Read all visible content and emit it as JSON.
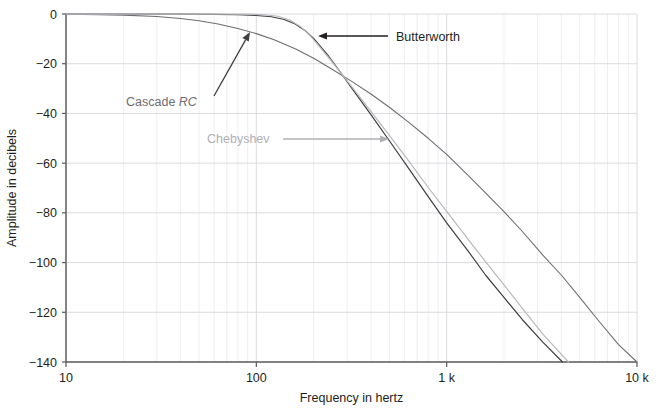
{
  "chart_data": {
    "type": "line",
    "title": "",
    "xlabel": "Frequency in hertz",
    "ylabel": "Amplitude in decibels",
    "xscale": "log",
    "yscale": "linear",
    "xlim": [
      10,
      10000
    ],
    "ylim": [
      -140,
      0
    ],
    "grid": true,
    "grid_minor": true,
    "legend": "annotations",
    "x_ticks": [
      {
        "value": 10,
        "label": "10"
      },
      {
        "value": 100,
        "label": "100"
      },
      {
        "value": 1000,
        "label": "1 k"
      },
      {
        "value": 10000,
        "label": "10 k"
      }
    ],
    "y_ticks": [
      {
        "value": 0,
        "label": "0"
      },
      {
        "value": -20,
        "label": "−20"
      },
      {
        "value": -40,
        "label": "−40"
      },
      {
        "value": -60,
        "label": "−60"
      },
      {
        "value": -80,
        "label": "−80"
      },
      {
        "value": -100,
        "label": "−100"
      },
      {
        "value": -120,
        "label": "−120"
      },
      {
        "value": -140,
        "label": "−140"
      }
    ],
    "series": [
      {
        "name": "Butterworth",
        "color": "#3f3f42",
        "width": 1.2,
        "points": [
          [
            10,
            -0.02
          ],
          [
            20,
            -0.04
          ],
          [
            40,
            -0.08
          ],
          [
            60,
            -0.15
          ],
          [
            80,
            -0.3
          ],
          [
            100,
            -0.6
          ],
          [
            120,
            -1.1
          ],
          [
            140,
            -2.2
          ],
          [
            160,
            -4.0
          ],
          [
            180,
            -6.6
          ],
          [
            200,
            -9.8
          ],
          [
            240,
            -17.0
          ],
          [
            280,
            -24.0
          ],
          [
            320,
            -30.2
          ],
          [
            400,
            -40.5
          ],
          [
            500,
            -51.0
          ],
          [
            630,
            -62.0
          ],
          [
            800,
            -73.5
          ],
          [
            1000,
            -84.0
          ],
          [
            1300,
            -95.5
          ],
          [
            1600,
            -105.0
          ],
          [
            2000,
            -114.0
          ],
          [
            2500,
            -123.0
          ],
          [
            3200,
            -132.0
          ],
          [
            4000,
            -139.5
          ],
          [
            5000,
            -147.0
          ],
          [
            6300,
            -154.5
          ],
          [
            8000,
            -162.0
          ],
          [
            10000,
            -140.0
          ]
        ]
      },
      {
        "name": "Cascade RC",
        "color": "#6e6e73",
        "width": 1.1,
        "points": [
          [
            10,
            -0.1
          ],
          [
            15,
            -0.25
          ],
          [
            20,
            -0.45
          ],
          [
            30,
            -1.0
          ],
          [
            40,
            -1.8
          ],
          [
            50,
            -2.7
          ],
          [
            63,
            -4.0
          ],
          [
            80,
            -5.8
          ],
          [
            100,
            -7.9
          ],
          [
            125,
            -10.5
          ],
          [
            160,
            -14.0
          ],
          [
            200,
            -17.8
          ],
          [
            250,
            -22.2
          ],
          [
            320,
            -27.3
          ],
          [
            400,
            -32.2
          ],
          [
            500,
            -37.5
          ],
          [
            630,
            -43.5
          ],
          [
            800,
            -50.0
          ],
          [
            1000,
            -56.5
          ],
          [
            1300,
            -65.0
          ],
          [
            1600,
            -72.0
          ],
          [
            2000,
            -79.5
          ],
          [
            2500,
            -87.5
          ],
          [
            3200,
            -97.0
          ],
          [
            4000,
            -105.0
          ],
          [
            5000,
            -114.0
          ],
          [
            6300,
            -123.5
          ],
          [
            8000,
            -133.0
          ],
          [
            10000,
            -140.0
          ]
        ]
      },
      {
        "name": "Chebyshev",
        "color": "#b9b9bd",
        "width": 1.2,
        "points": [
          [
            10,
            -0.05
          ],
          [
            30,
            -0.05
          ],
          [
            60,
            -0.02
          ],
          [
            90,
            -0.05
          ],
          [
            110,
            -0.3
          ],
          [
            130,
            -0.9
          ],
          [
            150,
            -2.4
          ],
          [
            170,
            -5.0
          ],
          [
            190,
            -8.4
          ],
          [
            210,
            -12.2
          ],
          [
            240,
            -17.6
          ],
          [
            280,
            -24.0
          ],
          [
            320,
            -29.6
          ],
          [
            400,
            -39.2
          ],
          [
            500,
            -48.8
          ],
          [
            630,
            -59.0
          ],
          [
            800,
            -69.8
          ],
          [
            1000,
            -79.4
          ],
          [
            1300,
            -90.8
          ],
          [
            1600,
            -99.6
          ],
          [
            2000,
            -109.0
          ],
          [
            2500,
            -118.4
          ],
          [
            3200,
            -128.8
          ],
          [
            4000,
            -136.8
          ],
          [
            5000,
            -145.0
          ],
          [
            6000,
            -140.0
          ]
        ]
      }
    ],
    "annotations": [
      {
        "id": "cascade-rc",
        "label_plain": "Cascade",
        "label_italic": "RC",
        "color": "#6e6e73",
        "arrow_color": "#3f3f42",
        "text_x": 126,
        "text_y": 106,
        "arrow_from_x": 214,
        "arrow_from_y": 96,
        "arrow_to_x": 250,
        "arrow_to_y": 32
      },
      {
        "id": "chebyshev",
        "label_plain": "Chebyshev",
        "label_italic": "",
        "color": "#b0b0b5",
        "arrow_color": "#b0b0b5",
        "text_x": 207,
        "text_y": 143,
        "arrow_from_x": 283,
        "arrow_from_y": 139,
        "arrow_to_x": 389,
        "arrow_to_y": 139
      },
      {
        "id": "butterworth",
        "label_plain": "Butterworth",
        "label_italic": "",
        "color": "#231f20",
        "arrow_color": "#231f20",
        "text_x": 396,
        "text_y": 41,
        "arrow_from_x": 388,
        "arrow_from_y": 36,
        "arrow_to_x": 318,
        "arrow_to_y": 36
      }
    ],
    "style": {
      "axis_color": "#58585b",
      "grid_major_color": "#d8d8dc",
      "grid_minor_color": "#e6e6ea",
      "background": "#ffffff",
      "plot_left": 66,
      "plot_right": 637,
      "plot_top": 14,
      "plot_bottom": 362
    }
  }
}
